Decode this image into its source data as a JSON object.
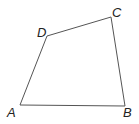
{
  "diagram": {
    "type": "quadrilateral",
    "stroke_color": "#555555",
    "vertices": [
      {
        "label": "A",
        "x": 20,
        "y": 105
      },
      {
        "label": "B",
        "x": 125,
        "y": 106
      },
      {
        "label": "C",
        "x": 111,
        "y": 17
      },
      {
        "label": "D",
        "x": 47,
        "y": 36
      }
    ],
    "labels": {
      "A": "A",
      "B": "B",
      "C": "C",
      "D": "D"
    }
  }
}
